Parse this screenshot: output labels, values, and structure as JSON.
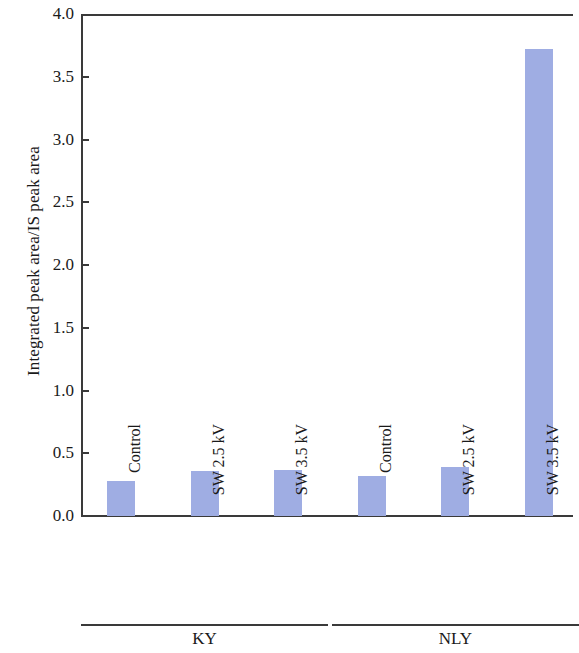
{
  "chart_data": {
    "type": "bar",
    "title": "",
    "xlabel": "",
    "ylabel": "Integrated peak area/IS peak area",
    "ylim": [
      0.0,
      4.0
    ],
    "ytick_labels": [
      "4.0",
      "3.5",
      "3.0",
      "2.5",
      "2.0",
      "1.5",
      "1.0",
      "0.5",
      "0.0"
    ],
    "ytick_values": [
      4.0,
      3.5,
      3.0,
      2.5,
      2.0,
      1.5,
      1.0,
      0.5,
      0.0
    ],
    "grid": false,
    "legend": null,
    "bar_color": "#9fade3",
    "axis_color": "#3a3a3a",
    "categories": [
      "Control",
      "SW 2.5 kV",
      "SW 3.5 kV",
      "Control",
      "SW 2.5 kV",
      "SW 3.5 kV"
    ],
    "values": [
      0.28,
      0.36,
      0.37,
      0.32,
      0.39,
      3.72
    ],
    "groups": [
      {
        "label": "KY",
        "categories": [
          "Control",
          "SW 2.5 kV",
          "SW 3.5 kV"
        ],
        "values": [
          0.28,
          0.36,
          0.37
        ]
      },
      {
        "label": "NLY",
        "categories": [
          "Control",
          "SW 2.5 kV",
          "SW 3.5 kV"
        ],
        "values": [
          0.32,
          0.39,
          3.72
        ]
      }
    ]
  },
  "axis": {
    "y_title": "Integrated peak area/IS peak area",
    "ticks": [
      {
        "label": "4.0",
        "value": 4.0
      },
      {
        "label": "3.5",
        "value": 3.5
      },
      {
        "label": "3.0",
        "value": 3.0
      },
      {
        "label": "2.5",
        "value": 2.5
      },
      {
        "label": "2.0",
        "value": 2.0
      },
      {
        "label": "1.5",
        "value": 1.5
      },
      {
        "label": "1.0",
        "value": 1.0
      },
      {
        "label": "0.5",
        "value": 0.5
      },
      {
        "label": "0.0",
        "value": 0.0
      }
    ]
  },
  "bars": [
    {
      "label": "Control",
      "value": 0.28,
      "group": "KY"
    },
    {
      "label": "SW 2.5 kV",
      "value": 0.36,
      "group": "KY"
    },
    {
      "label": "SW 3.5 kV",
      "value": 0.37,
      "group": "KY"
    },
    {
      "label": "Control",
      "value": 0.32,
      "group": "NLY"
    },
    {
      "label": "SW 2.5 kV",
      "value": 0.39,
      "group": "NLY"
    },
    {
      "label": "SW 3.5 kV",
      "value": 3.72,
      "group": "NLY"
    }
  ],
  "groups": [
    {
      "label": "KY"
    },
    {
      "label": "NLY"
    }
  ]
}
